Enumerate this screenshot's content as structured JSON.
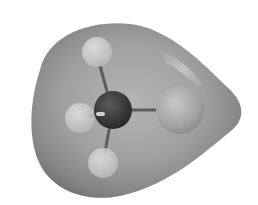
{
  "figure": {
    "background": "#ffffff",
    "surface": {
      "color_light": "#c4c4c4",
      "color_mid": "#9a9a9a",
      "color_dark": "#6e6e6e",
      "highlight": "#d8d8d8"
    },
    "atoms": [
      {
        "element": "C",
        "cx": 113,
        "cy": 110,
        "r": 19,
        "color": "#3a3a3a"
      },
      {
        "element": "Cl",
        "cx": 180,
        "cy": 110,
        "r": 24,
        "color": "#a8a8a8"
      },
      {
        "element": "H",
        "cx": 97,
        "cy": 52,
        "r": 15,
        "color": "#cfcfcf"
      },
      {
        "element": "H",
        "cx": 80,
        "cy": 118,
        "r": 15,
        "color": "#c8c8c8"
      },
      {
        "element": "H",
        "cx": 103,
        "cy": 163,
        "r": 15,
        "color": "#c4c4c4"
      }
    ],
    "bonds": [
      {
        "from": 0,
        "to": 1
      },
      {
        "from": 0,
        "to": 2
      },
      {
        "from": 0,
        "to": 3
      },
      {
        "from": 0,
        "to": 4
      }
    ]
  }
}
